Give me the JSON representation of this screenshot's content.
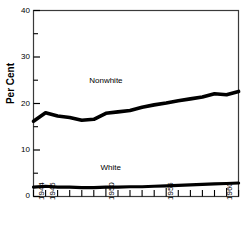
{
  "chart_data": {
    "type": "line",
    "title": "",
    "subtitle": "",
    "xlabel": "",
    "ylabel": "Per Cent",
    "xlim": [
      1944,
      1961
    ],
    "ylim": [
      0,
      40
    ],
    "grid": false,
    "legend_position": "inline-annotation",
    "y_ticks_major": [
      0,
      10,
      20,
      30,
      40
    ],
    "y_ticks_minor": [
      5,
      15,
      25,
      35
    ],
    "y_tick_labels": [
      "0",
      "10",
      "20",
      "30",
      "40"
    ],
    "x_ticks": [
      1944,
      1945,
      1946,
      1947,
      1948,
      1949,
      1950,
      1951,
      1952,
      1953,
      1954,
      1955,
      1956,
      1957,
      1958,
      1959,
      1960,
      1961
    ],
    "x_tick_labels_shown": [
      "1944",
      "1945",
      "1950",
      "1955",
      "1960"
    ],
    "x_tick_label_years": [
      1944,
      1945,
      1950,
      1955,
      1960
    ],
    "x": [
      1944,
      1945,
      1946,
      1947,
      1948,
      1949,
      1950,
      1951,
      1952,
      1953,
      1954,
      1955,
      1956,
      1957,
      1958,
      1959,
      1960,
      1961
    ],
    "series": [
      {
        "name": "Nonwhite",
        "color": "#000000",
        "values": [
          16.2,
          18.0,
          17.3,
          17.0,
          16.4,
          16.6,
          17.9,
          18.2,
          18.5,
          19.2,
          19.7,
          20.1,
          20.6,
          21.0,
          21.4,
          22.1,
          21.9,
          22.6
        ],
        "label_x": 1950.0,
        "label_y": 24.5
      },
      {
        "name": "White",
        "color": "#000000",
        "values": [
          2.0,
          2.2,
          2.0,
          2.0,
          1.9,
          1.9,
          2.0,
          2.0,
          2.1,
          2.1,
          2.2,
          2.3,
          2.4,
          2.5,
          2.6,
          2.7,
          2.8,
          2.9
        ],
        "label_x": 1950.4,
        "label_y": 5.6
      }
    ],
    "annotations": [
      {
        "text": "Nonwhite",
        "x": 1950.0,
        "y": 24.5
      },
      {
        "text": "White",
        "x": 1950.4,
        "y": 5.6
      }
    ]
  },
  "axes": {
    "y_title": "Per Cent",
    "y_labels": [
      "40",
      "30",
      "20",
      "10",
      "0"
    ],
    "x_labels": [
      "1944",
      "1945",
      "1950",
      "1955",
      "1960"
    ]
  },
  "colors": {
    "background": "#ffffff",
    "foreground": "#000000",
    "line": "#000000",
    "frame": "#3a3a3a"
  }
}
